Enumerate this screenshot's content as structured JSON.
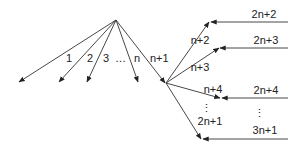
{
  "diagram": {
    "type": "branching-arrow-diagram",
    "root_labels": [
      "1",
      "2",
      "3",
      "…",
      "n",
      "n+1"
    ],
    "hub_labels": [
      "n+2",
      "n+3",
      "n+4",
      "⋮",
      "2n+1"
    ],
    "incoming_labels": [
      "2n+2",
      "2n+3",
      "2n+4",
      "⋮",
      "3n+1"
    ],
    "colors": {
      "stroke": "#333333",
      "text": "#222222",
      "background": "#ffffff"
    }
  }
}
